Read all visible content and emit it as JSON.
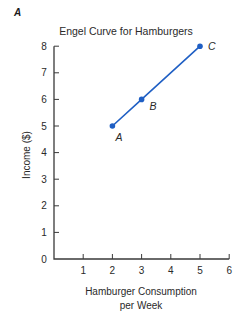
{
  "panel_label": "A",
  "chart_data": {
    "type": "line",
    "title": "Engel Curve for Hamburgers",
    "xlabel": "Hamburger Consumption per Week",
    "xlabel_lines": [
      "Hamburger Consumption",
      "per Week"
    ],
    "ylabel": "Income ($)",
    "xlim": [
      0,
      6
    ],
    "ylim": [
      0,
      8
    ],
    "x_ticks": [
      1,
      2,
      3,
      4,
      5,
      6
    ],
    "y_ticks": [
      0,
      1,
      2,
      3,
      4,
      5,
      6,
      7,
      8
    ],
    "grid": false,
    "series": [
      {
        "name": "Engel Curve",
        "color": "#1f5fc4",
        "points": [
          {
            "label": "A",
            "x": 2,
            "y": 5
          },
          {
            "label": "B",
            "x": 3,
            "y": 6
          },
          {
            "label": "C",
            "x": 5,
            "y": 8
          }
        ]
      }
    ]
  }
}
